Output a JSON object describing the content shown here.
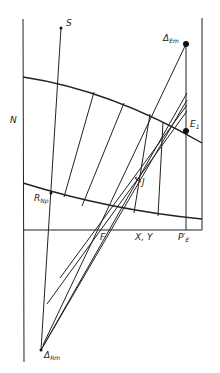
{
  "diagram": {
    "type": "ponchon-savarit-enthalpy-composition-construction",
    "axis_labels": {
      "y_axis": "N",
      "x_axis": "X, Y"
    },
    "points": {
      "S": {
        "label": "S",
        "x": 61,
        "y": 28
      },
      "delta_em": {
        "label": "Δ",
        "sub": "Em",
        "x": 186,
        "y": 44
      },
      "e1": {
        "label": "E",
        "sub": "1",
        "x": 186,
        "y": 131
      },
      "f": {
        "label": "F",
        "x": 97,
        "y": 230
      },
      "r_np": {
        "label": "R",
        "sub": "Np",
        "x": 51,
        "y": 193
      },
      "delta_rm": {
        "label": "Δ",
        "sub": "Rm",
        "x": 41,
        "y": 350
      },
      "p_e": {
        "label": "P′",
        "sub": "E",
        "x": 186,
        "y": 230
      }
    },
    "annotation_j": {
      "label": "J"
    },
    "colors": {
      "line": "#222222",
      "background": "#ffffff"
    }
  }
}
